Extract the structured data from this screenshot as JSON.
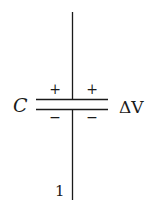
{
  "diagram": {
    "type": "capacitor-symbol",
    "capacitance_label": "C",
    "voltage_label": "ΔV",
    "top_plate_signs": [
      "+",
      "+"
    ],
    "bottom_plate_signs": [
      "−",
      "−"
    ],
    "wire_label": "1",
    "colors": {
      "line": "#1a1a1a",
      "background": "#ffffff"
    }
  }
}
